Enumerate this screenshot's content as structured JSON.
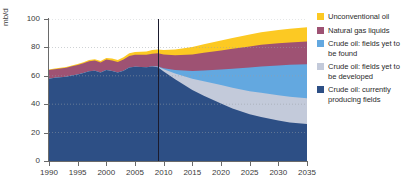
{
  "chart_data": {
    "type": "area",
    "title": "",
    "subtitle": "",
    "xlabel": "",
    "ylabel": "mb/d",
    "yunit": "mb/d",
    "xlim": [
      1990,
      2035
    ],
    "ylim": [
      0,
      100
    ],
    "grid": true,
    "gridlines_horizontal": [
      20,
      40,
      60,
      80,
      100
    ],
    "legend_position": "right",
    "stacked": true,
    "divider_year": 2009,
    "divider_label": "",
    "xticks": [
      1990,
      1995,
      2000,
      2005,
      2010,
      2015,
      2020,
      2025,
      2030,
      2035
    ],
    "yticks": [
      0,
      20,
      40,
      60,
      80,
      100
    ],
    "x": [
      1990,
      1991,
      1992,
      1993,
      1994,
      1995,
      1996,
      1997,
      1998,
      1999,
      2000,
      2001,
      2002,
      2003,
      2004,
      2005,
      2006,
      2007,
      2008,
      2009,
      2010,
      2012,
      2015,
      2017,
      2020,
      2022,
      2025,
      2027,
      2030,
      2032,
      2035
    ],
    "series": [
      {
        "name": "Crude oil: currently producing fields",
        "color": "#2d4f85",
        "values": [
          58.0,
          58.6,
          59.0,
          59.4,
          60.2,
          61.0,
          62.0,
          63.2,
          63.6,
          62.4,
          64.0,
          63.4,
          62.4,
          63.6,
          65.8,
          66.4,
          66.2,
          66.0,
          66.6,
          66.0,
          63.0,
          57.5,
          50.0,
          46.0,
          40.5,
          37.0,
          33.0,
          31.0,
          28.5,
          27.2,
          26.0
        ]
      },
      {
        "name": "Crude oil: fields yet to be developed",
        "color": "#c3cada",
        "values": [
          0,
          0,
          0,
          0,
          0,
          0,
          0,
          0,
          0,
          0,
          0,
          0,
          0,
          0,
          0,
          0,
          0,
          0,
          0,
          0.4,
          1.6,
          4.2,
          8.0,
          10.2,
          13.0,
          14.6,
          16.2,
          17.0,
          17.8,
          18.0,
          18.2
        ]
      },
      {
        "name": "Crude oil: fields yet to be found",
        "color": "#63a8e0",
        "values": [
          0,
          0,
          0,
          0,
          0,
          0,
          0,
          0,
          0,
          0,
          0,
          0,
          0,
          0,
          0,
          0,
          0,
          0,
          0,
          0.2,
          0.8,
          2.4,
          5.4,
          7.6,
          11.0,
          13.4,
          16.6,
          18.6,
          21.0,
          22.5,
          24.0
        ]
      },
      {
        "name": "Natural gas liquids",
        "color": "#9e5273",
        "values": [
          6.0,
          6.1,
          6.2,
          6.3,
          6.5,
          6.6,
          6.8,
          7.0,
          7.1,
          7.0,
          7.4,
          7.4,
          7.4,
          7.8,
          8.2,
          8.4,
          8.6,
          8.8,
          9.0,
          9.2,
          9.6,
          10.4,
          11.6,
          12.4,
          13.4,
          14.0,
          14.8,
          15.2,
          15.6,
          15.8,
          16.0
        ]
      },
      {
        "name": "Unconventional oil",
        "color": "#fcc923",
        "values": [
          0.4,
          0.4,
          0.5,
          0.5,
          0.6,
          0.7,
          0.8,
          0.9,
          1.0,
          1.0,
          1.2,
          1.3,
          1.4,
          1.6,
          1.8,
          2.0,
          2.2,
          2.4,
          2.6,
          2.8,
          3.2,
          4.0,
          5.2,
          6.0,
          7.0,
          7.6,
          8.4,
          8.9,
          9.4,
          9.7,
          10.0
        ]
      }
    ]
  },
  "axes": {
    "y_unit_label": "mb/d",
    "y_tick_labels": [
      "0",
      "20",
      "40",
      "60",
      "80",
      "100"
    ],
    "x_tick_labels": [
      "1990",
      "1995",
      "2000",
      "2005",
      "2010",
      "2015",
      "2020",
      "2025",
      "2030",
      "2035"
    ]
  },
  "legend": {
    "items": [
      {
        "label": "Unconventional oil",
        "color": "#fcc923"
      },
      {
        "label": "Natural gas liquids",
        "color": "#9e5273"
      },
      {
        "label": "Crude oil: fields yet to be found",
        "color": "#63a8e0"
      },
      {
        "label": "Crude oil: fields yet to be developed",
        "color": "#c3cada"
      },
      {
        "label": "Crude oil: currently producing fields",
        "color": "#2d4f85"
      }
    ]
  }
}
